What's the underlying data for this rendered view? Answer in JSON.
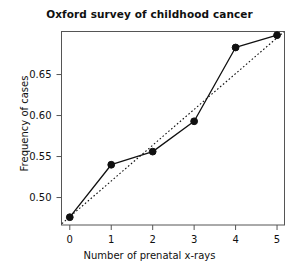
{
  "chart_data": {
    "type": "line",
    "title": "Oxford survey of childhood cancer",
    "xlabel": "Number of prenatal x-rays",
    "ylabel": "Frequency of cases",
    "x": [
      0,
      1,
      2,
      3,
      4,
      5
    ],
    "xtick_labels": [
      "0",
      "1",
      "2",
      "3",
      "4",
      "5"
    ],
    "ytick_labels": [
      "0.50",
      "0.55",
      "0.60",
      "0.65"
    ],
    "ytick_values": [
      0.5,
      0.55,
      0.6,
      0.65
    ],
    "xlim": [
      -0.2,
      5.18
    ],
    "ylim": [
      0.4665,
      0.7025
    ],
    "grid": false,
    "legend": null,
    "series": [
      {
        "name": "observed",
        "style": "solid-with-markers",
        "marker": "filled-circle",
        "color": "#101010",
        "values": [
          0.476,
          0.54,
          0.556,
          0.593,
          0.683,
          0.698
        ]
      },
      {
        "name": "fitted-trend",
        "style": "dotted",
        "color": "#101010",
        "endpoints": [
          {
            "x": -0.19,
            "y": 0.4682
          },
          {
            "x": 5.16,
            "y": 0.7018
          }
        ]
      }
    ]
  },
  "figure": {
    "background": "#ffffff",
    "axis_color": "#555555",
    "ink_color": "#101010"
  }
}
